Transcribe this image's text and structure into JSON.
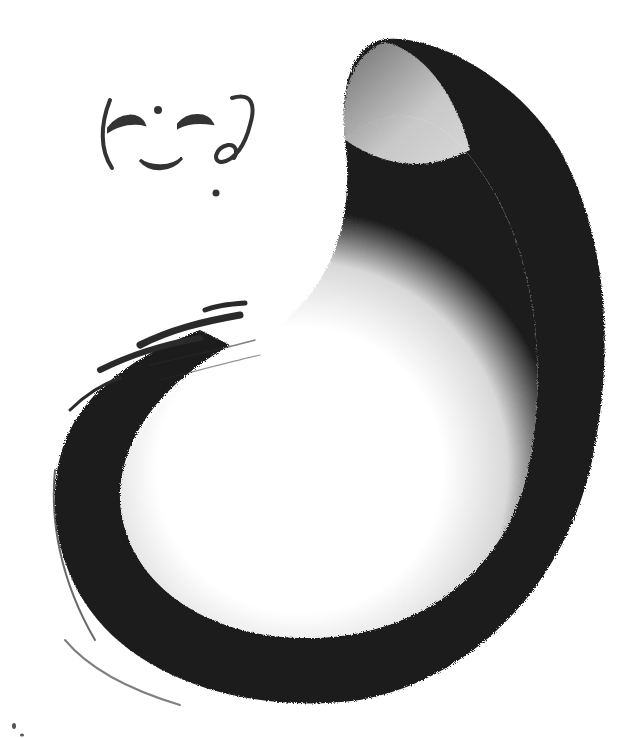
{
  "artwork": {
    "subject": "ink brush spiral stroke with small drawn face",
    "ink_color": "#1e1e1e",
    "paper_color": "#ffffff",
    "wash_color": "#bdbdbd",
    "face": {
      "glyphs": [
        "(",
        "-",
        "·",
        "-",
        "‿",
        "ʔ"
      ]
    }
  }
}
